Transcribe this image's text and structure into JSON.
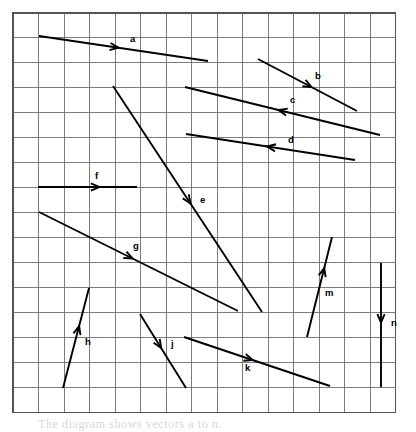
{
  "figure": {
    "background_color": "#ffffff",
    "caption": "The diagram shows vectors a to n."
  },
  "grid": {
    "x_origin": 13,
    "y_origin": 13,
    "cell_width": 25.5,
    "cell_height": 24.95,
    "columns": 15,
    "rows": 16,
    "line_color": "#6e6e6e",
    "border_color": "#555555",
    "width": 382,
    "height": 399
  },
  "chart_data": {
    "type": "scatter",
    "xlabel": "",
    "ylabel": "",
    "grid": true,
    "legend": "none",
    "xlim": [
      0,
      15
    ],
    "ylim": [
      0,
      16
    ],
    "vectors": [
      {
        "label": "a",
        "x1": 39,
        "y1": 36,
        "x2": 208,
        "y2": 61,
        "arrow_t": 0.47,
        "label_x": 130,
        "label_y": 42,
        "dir": "right-down"
      },
      {
        "label": "b",
        "x1": 258,
        "y1": 59,
        "x2": 357,
        "y2": 111,
        "arrow_t": 0.54,
        "label_x": 315,
        "label_y": 79,
        "dir": "right-down"
      },
      {
        "label": "c",
        "x1": 380,
        "y1": 135,
        "x2": 185,
        "y2": 87,
        "arrow_t": 0.52,
        "label_x": 290,
        "label_y": 103,
        "dir": "left-up"
      },
      {
        "label": "d",
        "x1": 355,
        "y1": 160,
        "x2": 186,
        "y2": 134,
        "arrow_t": 0.52,
        "label_x": 288,
        "label_y": 143,
        "dir": "left-up"
      },
      {
        "label": "e",
        "x1": 113,
        "y1": 86,
        "x2": 262,
        "y2": 312,
        "arrow_t": 0.52,
        "label_x": 200,
        "label_y": 203,
        "dir": "down-right"
      },
      {
        "label": "f",
        "x1": 38,
        "y1": 187,
        "x2": 137,
        "y2": 187,
        "arrow_t": 0.62,
        "label_x": 95,
        "label_y": 179,
        "dir": "right"
      },
      {
        "label": "g",
        "x1": 39,
        "y1": 212,
        "x2": 238,
        "y2": 311,
        "arrow_t": 0.47,
        "label_x": 133,
        "label_y": 249,
        "dir": "right-down"
      },
      {
        "label": "h",
        "x1": 63,
        "y1": 388,
        "x2": 89,
        "y2": 288,
        "arrow_t": 0.62,
        "label_x": 85,
        "label_y": 345,
        "dir": "up-right"
      },
      {
        "label": "j",
        "x1": 140,
        "y1": 314,
        "x2": 186,
        "y2": 388,
        "arrow_t": 0.46,
        "label_x": 171,
        "label_y": 347,
        "dir": "down-right"
      },
      {
        "label": "k",
        "x1": 184,
        "y1": 337,
        "x2": 330,
        "y2": 386,
        "arrow_t": 0.47,
        "label_x": 245,
        "label_y": 371,
        "dir": "right-down"
      },
      {
        "label": "m",
        "x1": 307,
        "y1": 337,
        "x2": 332,
        "y2": 237,
        "arrow_t": 0.69,
        "label_x": 325,
        "label_y": 296,
        "dir": "up-right"
      },
      {
        "label": "n",
        "x1": 381,
        "y1": 263,
        "x2": 381,
        "y2": 387,
        "arrow_t": 0.48,
        "label_x": 391,
        "label_y": 326,
        "dir": "down"
      }
    ]
  }
}
